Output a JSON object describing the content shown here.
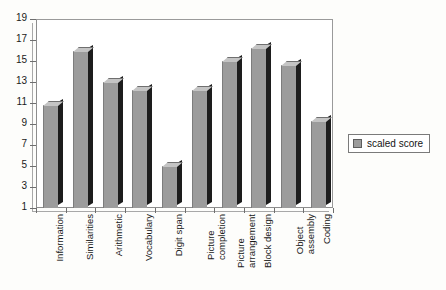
{
  "chart_data": {
    "type": "bar",
    "title": "",
    "xlabel": "",
    "ylabel": "",
    "ylim": [
      1,
      19
    ],
    "ytick_step": 2,
    "yticks": [
      1,
      3,
      5,
      7,
      9,
      11,
      13,
      15,
      17,
      19
    ],
    "grid": false,
    "legend_position": "right",
    "categories": [
      "Information",
      "Similarities",
      "Arithmetic",
      "Vocabulary",
      "Digit span",
      "Picture completion",
      "Picture arrangement",
      "Block design",
      "Object assembly",
      "Coding"
    ],
    "category_lines": [
      [
        "Information"
      ],
      [
        "Similarities"
      ],
      [
        "Arithmetic"
      ],
      [
        "Vocabulary"
      ],
      [
        "Digit span"
      ],
      [
        "Picture",
        "completion"
      ],
      [
        "Picture",
        "arrangement"
      ],
      [
        "Block design"
      ],
      [
        "Object",
        "assembly"
      ],
      [
        "Coding"
      ]
    ],
    "series": [
      {
        "name": "scaled score",
        "color": "#9c9c9c",
        "values": [
          10.8,
          16.0,
          13.0,
          12.2,
          5.0,
          12.2,
          15.0,
          16.2,
          14.6,
          9.3
        ]
      }
    ]
  },
  "legend": {
    "entries": [
      {
        "label": "scaled score",
        "color": "#9c9c9c"
      }
    ]
  }
}
